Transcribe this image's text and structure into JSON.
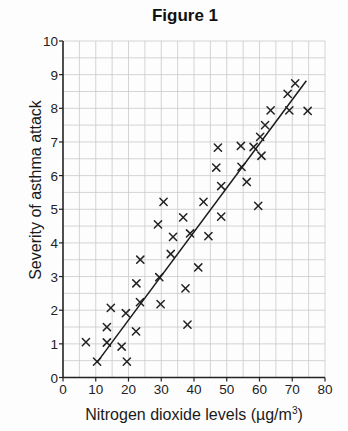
{
  "figure": {
    "title": "Figure 1"
  },
  "chart_data": {
    "type": "scatter",
    "title": "Figure 1",
    "xlabel": "Nitrogen dioxide levels (µg/m³)",
    "xlabel_main": "Nitrogen dioxide levels (µg/m",
    "xlabel_sup": "3",
    "xlabel_close": ")",
    "ylabel": "Severity of asthma attack",
    "xlim": [
      0,
      80
    ],
    "ylim": [
      0,
      10
    ],
    "xticks": [
      0,
      10,
      20,
      30,
      40,
      50,
      60,
      70,
      80
    ],
    "yticks": [
      0,
      1,
      2,
      3,
      4,
      5,
      6,
      7,
      8,
      9,
      10
    ],
    "grid": true,
    "grid_minor_x": 5,
    "grid_minor_y": 0.5,
    "legend": null,
    "marker": "x",
    "series": [
      {
        "name": "observations",
        "points": [
          [
            7.0,
            1.05
          ],
          [
            10.4,
            0.47
          ],
          [
            13.4,
            1.04
          ],
          [
            13.4,
            1.5
          ],
          [
            14.6,
            2.07
          ],
          [
            17.9,
            0.92
          ],
          [
            19.2,
            1.91
          ],
          [
            19.5,
            0.47
          ],
          [
            22.3,
            1.37
          ],
          [
            22.4,
            2.8
          ],
          [
            23.5,
            2.24
          ],
          [
            23.6,
            3.5
          ],
          [
            29.4,
            2.98
          ],
          [
            29.8,
            2.18
          ],
          [
            29.0,
            4.55
          ],
          [
            30.7,
            5.22
          ],
          [
            32.9,
            3.67
          ],
          [
            33.6,
            4.18
          ],
          [
            36.7,
            4.76
          ],
          [
            37.4,
            2.65
          ],
          [
            38.0,
            1.57
          ],
          [
            38.8,
            4.28
          ],
          [
            41.3,
            3.27
          ],
          [
            42.9,
            5.22
          ],
          [
            44.4,
            4.2
          ],
          [
            48.3,
            4.78
          ],
          [
            48.3,
            5.69
          ],
          [
            46.8,
            6.24
          ],
          [
            47.3,
            6.83
          ],
          [
            54.3,
            6.88
          ],
          [
            54.5,
            6.26
          ],
          [
            56.1,
            5.81
          ],
          [
            58.2,
            6.85
          ],
          [
            59.6,
            5.1
          ],
          [
            60.2,
            7.15
          ],
          [
            60.6,
            6.59
          ],
          [
            61.7,
            7.5
          ],
          [
            63.4,
            7.94
          ],
          [
            68.6,
            8.43
          ],
          [
            69.1,
            7.94
          ],
          [
            70.9,
            8.74
          ],
          [
            74.7,
            7.92
          ]
        ]
      }
    ],
    "fit_line": {
      "name": "line of best fit",
      "start": [
        10.4,
        0.45
      ],
      "end": [
        74.3,
        8.82
      ]
    }
  }
}
